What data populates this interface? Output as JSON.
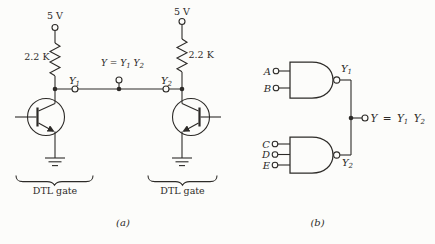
{
  "colors": {
    "ink": "#2d2b28",
    "paper": "#fcfcfa"
  },
  "panel_a": {
    "caption": "(a)",
    "left_gate": {
      "supply": "5 V",
      "resistor": "2.2 K",
      "caption": "DTL gate"
    },
    "right_gate": {
      "supply": "5 V",
      "resistor": "2.2 K",
      "caption": "DTL gate"
    },
    "y1": {
      "base": "Y",
      "sub": "1"
    },
    "y2": {
      "base": "Y",
      "sub": "2"
    },
    "output_parts": [
      "Y = Y",
      "1",
      " Y",
      "2"
    ]
  },
  "panel_b": {
    "caption": "(b)",
    "gate1": {
      "inputs": [
        "A",
        "B"
      ],
      "output": {
        "base": "Y",
        "sub": "1"
      }
    },
    "gate2": {
      "inputs": [
        "C",
        "D",
        "E"
      ],
      "output": {
        "base": "Y",
        "sub": "2"
      }
    },
    "output_parts": [
      "Y = Y",
      "1",
      " Y",
      "2"
    ]
  }
}
